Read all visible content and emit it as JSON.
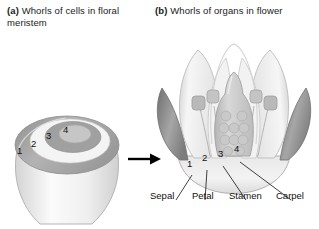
{
  "figure": {
    "panel_a": {
      "tag": "(a)",
      "caption": "Whorls of cells in floral meristem",
      "whorl_numbers": [
        "1",
        "2",
        "3",
        "4"
      ]
    },
    "panel_b": {
      "tag": "(b)",
      "caption": "Whorls of organs in flower",
      "whorl_numbers": [
        "1",
        "2",
        "3",
        "4"
      ],
      "organ_labels": [
        "Sepal",
        "Petal",
        "Stamen",
        "Carpel"
      ]
    },
    "arrow": "right-arrow"
  },
  "colors": {
    "ink": "#111111",
    "ring_dark": "#9a9a9a",
    "ring_light": "#f2f2f2",
    "ring_mid": "#bdbdbd",
    "sepal": "#8e8e8e",
    "petal": "#ececec",
    "stamen": "#c9c9c9",
    "carpel": "#cfcfcf",
    "outline": "#9d9d9d"
  }
}
